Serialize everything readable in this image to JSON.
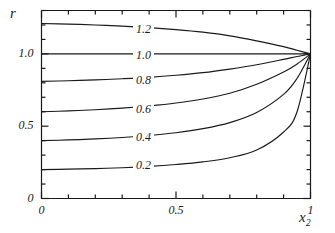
{
  "chart_data": {
    "type": "line",
    "title": "",
    "xlabel": "x₂",
    "ylabel": "r",
    "xlim": [
      0,
      1
    ],
    "ylim": [
      0,
      1.3
    ],
    "grid": false,
    "legend": "inline-curve-labels",
    "x_ticks_major": [
      {
        "value": 0,
        "label": "0"
      },
      {
        "value": 0.5,
        "label": "0.5"
      },
      {
        "value": 1,
        "label": "1"
      }
    ],
    "x_ticks_minor": [
      0.1,
      0.2,
      0.3,
      0.4,
      0.6,
      0.7,
      0.8,
      0.9
    ],
    "y_ticks_major": [
      {
        "value": 0,
        "label": "0"
      },
      {
        "value": 0.5,
        "label": "0.5"
      },
      {
        "value": 1.0,
        "label": "1.0"
      }
    ],
    "y_ticks_minor": [
      0.1,
      0.2,
      0.3,
      0.4,
      0.6,
      0.7,
      0.8,
      0.9,
      1.1,
      1.2,
      1.3
    ],
    "series": [
      {
        "name": "1.2",
        "label": "1.2",
        "x": [
          0,
          0.1,
          0.2,
          0.3,
          0.4,
          0.5,
          0.6,
          0.7,
          0.8,
          0.9,
          0.95,
          1.0
        ],
        "values": [
          1.21,
          1.206,
          1.2,
          1.192,
          1.182,
          1.168,
          1.15,
          1.125,
          1.09,
          1.05,
          1.025,
          1.0
        ]
      },
      {
        "name": "1.0",
        "label": "1.0",
        "x": [
          0,
          0.1,
          0.2,
          0.3,
          0.4,
          0.5,
          0.6,
          0.7,
          0.8,
          0.9,
          0.95,
          1.0
        ],
        "values": [
          1.0,
          1.0,
          1.0,
          1.0,
          1.0,
          1.0,
          1.0,
          1.0,
          1.0,
          1.0,
          1.0,
          1.0
        ]
      },
      {
        "name": "0.8",
        "label": "0.8",
        "x": [
          0,
          0.1,
          0.2,
          0.3,
          0.4,
          0.5,
          0.6,
          0.7,
          0.8,
          0.9,
          0.95,
          1.0
        ],
        "values": [
          0.81,
          0.814,
          0.82,
          0.828,
          0.838,
          0.852,
          0.87,
          0.895,
          0.925,
          0.962,
          0.982,
          1.0
        ]
      },
      {
        "name": "0.6",
        "label": "0.6",
        "x": [
          0,
          0.1,
          0.2,
          0.3,
          0.4,
          0.5,
          0.6,
          0.7,
          0.8,
          0.9,
          0.95,
          1.0
        ],
        "values": [
          0.6,
          0.606,
          0.614,
          0.625,
          0.64,
          0.66,
          0.688,
          0.728,
          0.79,
          0.875,
          0.93,
          1.0
        ]
      },
      {
        "name": "0.4",
        "label": "0.4",
        "x": [
          0,
          0.1,
          0.2,
          0.3,
          0.4,
          0.5,
          0.6,
          0.7,
          0.8,
          0.9,
          0.95,
          1.0
        ],
        "values": [
          0.4,
          0.405,
          0.412,
          0.422,
          0.436,
          0.455,
          0.483,
          0.525,
          0.595,
          0.72,
          0.83,
          1.0
        ]
      },
      {
        "name": "0.2",
        "label": "0.2",
        "x": [
          0,
          0.1,
          0.2,
          0.3,
          0.4,
          0.5,
          0.6,
          0.7,
          0.8,
          0.9,
          0.95,
          1.0
        ],
        "values": [
          0.2,
          0.203,
          0.207,
          0.213,
          0.222,
          0.235,
          0.253,
          0.282,
          0.335,
          0.46,
          0.6,
          1.0
        ]
      }
    ],
    "curve_label_positions": [
      {
        "label": "1.2",
        "x_px": 133,
        "y_px": 30
      },
      {
        "label": "1.0",
        "x_px": 133,
        "y_px": 56
      },
      {
        "label": "0.8",
        "x_px": 133,
        "y_px": 81
      },
      {
        "label": "0.6",
        "x_px": 133,
        "y_px": 110
      },
      {
        "label": "0.4",
        "x_px": 133,
        "y_px": 138
      },
      {
        "label": "0.2",
        "x_px": 133,
        "y_px": 166
      }
    ]
  }
}
